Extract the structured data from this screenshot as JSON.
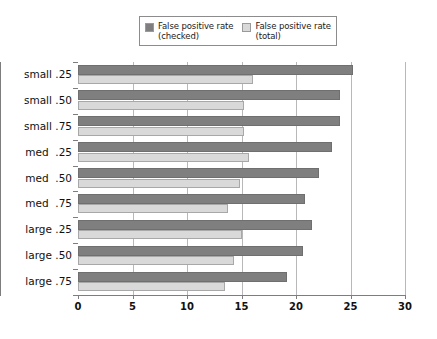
{
  "chart_data": {
    "type": "bar",
    "orientation": "horizontal",
    "title": "",
    "xlabel": "",
    "ylabel": "",
    "xlim": [
      0,
      30
    ],
    "xticks": [
      0,
      5,
      10,
      15,
      20,
      25,
      30
    ],
    "xtick_labels": [
      "0",
      "5",
      "10",
      "15",
      "20",
      "25",
      "30"
    ],
    "grid": true,
    "grid_axis": "x",
    "legend_position": "top-center",
    "categories": [
      "small .25",
      "small .50",
      "small .75",
      "med  .25",
      "med  .50",
      "med  .75",
      "large .25",
      "large .50",
      "large .75"
    ],
    "series": [
      {
        "name": "False positive rate\n(checked)",
        "color": "#7f7f7f",
        "values": [
          25.2,
          24.0,
          24.0,
          23.3,
          22.1,
          20.8,
          21.5,
          20.6,
          19.2
        ]
      },
      {
        "name": "False positive rate\n(total)",
        "color": "#d9d9d9",
        "values": [
          16.1,
          15.2,
          15.2,
          15.7,
          14.9,
          13.8,
          15.0,
          14.3,
          13.5
        ]
      }
    ]
  },
  "legend": {
    "entries": [
      {
        "label": "False positive rate\n(checked)",
        "swatch_color": "#7f7f7f"
      },
      {
        "label": "False positive rate\n(total)",
        "swatch_color": "#d9d9d9"
      }
    ]
  }
}
